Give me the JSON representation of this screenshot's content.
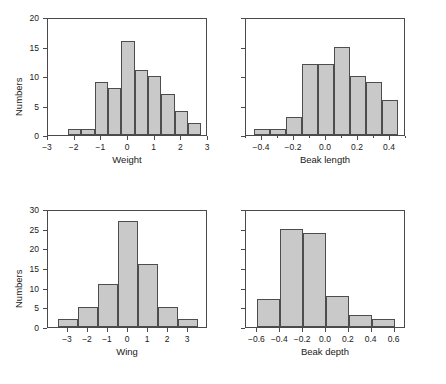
{
  "figure": {
    "width": 446,
    "height": 384,
    "background": "#ffffff",
    "bar_fill": "#c9c9c9",
    "bar_edge": "#4d4d4d",
    "axis_color": "#4a4a4a",
    "shared_ylabel": "Numbers"
  },
  "chart_data": [
    {
      "type": "bar",
      "name": "weight",
      "title": "",
      "xlabel": "Weight",
      "ylabel": "Numbers",
      "ylim": [
        0,
        20
      ],
      "yticks": [
        0,
        5,
        10,
        15,
        20
      ],
      "ytick_labels": [
        "0",
        "5",
        "10",
        "15",
        "20"
      ],
      "ytick_labels_visible": true,
      "xlim": [
        -3,
        3
      ],
      "xticks": [
        -3,
        -2,
        -1,
        0,
        1,
        2,
        3
      ],
      "xtick_labels": [
        "−3",
        "−2",
        "−1",
        "0",
        "1",
        "2",
        "3"
      ],
      "bin_width": 0.5,
      "bin_edges": [
        -2.25,
        -1.75,
        -1.25,
        -0.75,
        -0.25,
        0.25,
        0.75,
        1.25,
        1.75,
        2.25,
        2.75
      ],
      "values": [
        1,
        1,
        9,
        8,
        16,
        11,
        10,
        7,
        4,
        2
      ],
      "grid": false,
      "legend": false
    },
    {
      "type": "bar",
      "name": "beak-length",
      "title": "",
      "xlabel": "Beak length",
      "ylabel": "Numbers",
      "ylim": [
        0,
        20
      ],
      "yticks": [
        0,
        5,
        10,
        15,
        20
      ],
      "ytick_labels": [
        "",
        "",
        "",
        "",
        ""
      ],
      "ytick_labels_visible": false,
      "xlim": [
        -0.5,
        0.5
      ],
      "xticks": [
        -0.4,
        -0.2,
        0.0,
        0.2,
        0.4
      ],
      "xtick_labels": [
        "−0.4",
        "−0.2",
        "0.0",
        "0.2",
        "0.4"
      ],
      "xticks_minor": [
        -0.5,
        -0.3,
        -0.1,
        0.1,
        0.3,
        0.5
      ],
      "bin_width": 0.1,
      "bin_edges": [
        -0.45,
        -0.35,
        -0.25,
        -0.15,
        -0.05,
        0.05,
        0.15,
        0.25,
        0.35,
        0.45
      ],
      "values": [
        1,
        1,
        3,
        12,
        12,
        15,
        10,
        9,
        6
      ],
      "grid": false,
      "legend": false
    },
    {
      "type": "bar",
      "name": "wing",
      "title": "",
      "xlabel": "Wing",
      "ylabel": "Numbers",
      "ylim": [
        0,
        30
      ],
      "yticks": [
        0,
        5,
        10,
        15,
        20,
        25,
        30
      ],
      "ytick_labels": [
        "0",
        "5",
        "10",
        "15",
        "20",
        "25",
        "30"
      ],
      "ytick_labels_visible": true,
      "xlim": [
        -4,
        4
      ],
      "xticks": [
        -3,
        -2,
        -1,
        0,
        1,
        2,
        3
      ],
      "xtick_labels": [
        "−3",
        "−2",
        "−1",
        "0",
        "1",
        "2",
        "3"
      ],
      "bin_width": 1,
      "bin_edges": [
        -3.5,
        -2.5,
        -1.5,
        -0.5,
        0.5,
        1.5,
        2.5,
        3.5
      ],
      "values": [
        2,
        5,
        11,
        27,
        16,
        5,
        2
      ],
      "grid": false,
      "legend": false
    },
    {
      "type": "bar",
      "name": "beak-depth",
      "title": "",
      "xlabel": "Beak depth",
      "ylabel": "Numbers",
      "ylim": [
        0,
        30
      ],
      "yticks": [
        0,
        5,
        10,
        15,
        20,
        25,
        30
      ],
      "ytick_labels": [
        "",
        "",
        "",
        "",
        "",
        "",
        ""
      ],
      "ytick_labels_visible": false,
      "xlim": [
        -0.7,
        0.7
      ],
      "xticks": [
        -0.6,
        -0.4,
        -0.2,
        0.0,
        0.2,
        0.4,
        0.6
      ],
      "xtick_labels": [
        "−0.6",
        "−0.4",
        "−0.2",
        "0.0",
        "0.2",
        "0.4",
        "0.6"
      ],
      "bin_width": 0.2,
      "bin_edges": [
        -0.6,
        -0.4,
        -0.2,
        0.0,
        0.2,
        0.4,
        0.6
      ],
      "values": [
        7,
        25,
        24,
        8,
        3,
        2
      ],
      "grid": false,
      "legend": false
    }
  ]
}
